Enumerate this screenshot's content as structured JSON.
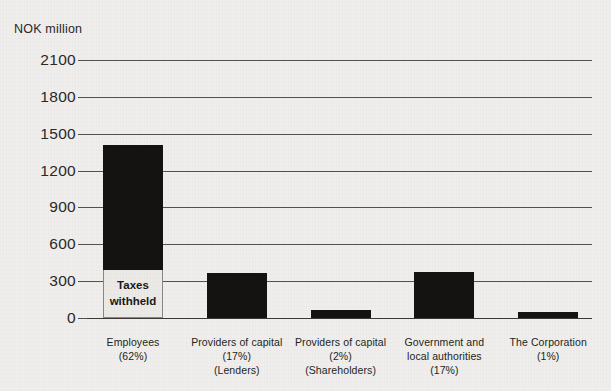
{
  "page": {
    "title_clipped": "VALUE ADDED CREATED",
    "background_color": "#efeeec",
    "bar_color": "#151212"
  },
  "chart_data": {
    "type": "bar",
    "title": "VALUE ADDED CREATED",
    "ylabel": "NOK million",
    "xlabel": "",
    "ylim": [
      0,
      2100
    ],
    "yticks": [
      0,
      300,
      600,
      900,
      1200,
      1500,
      1800,
      2100
    ],
    "ytick_labels": [
      "0",
      "300",
      "600",
      "900",
      "1200",
      "1500",
      "1800",
      "2100"
    ],
    "grid": true,
    "legend": "none",
    "categories": [
      "Employees (62%)",
      "Providers of capital (17%) (Lenders)",
      "Providers of capital (2%) (Shareholders)",
      "Government and local authorities (17%)",
      "The Corporation (1%)"
    ],
    "values": [
      1410,
      370,
      65,
      375,
      45
    ],
    "annotations": [
      {
        "target_category": "Employees (62%)",
        "text": "Taxes withheld",
        "segment_range": [
          0,
          390
        ]
      }
    ]
  },
  "axis": {
    "unit_caption": "NOK million",
    "ticks": [
      {
        "label": "2100"
      },
      {
        "label": "1800"
      },
      {
        "label": "1500"
      },
      {
        "label": "1200"
      },
      {
        "label": "900"
      },
      {
        "label": "600"
      },
      {
        "label": "300"
      },
      {
        "label": "0"
      }
    ]
  },
  "bars": [
    {
      "name": "employees",
      "value": 1410,
      "label_lines": [
        "Employees",
        "(62%)"
      ],
      "annotation_lines": [
        "Taxes",
        "withheld"
      ]
    },
    {
      "name": "providers-of-capital-lenders",
      "value": 370,
      "label_lines": [
        "Providers of capital",
        "(17%)",
        "(Lenders)"
      ],
      "annotation_lines": []
    },
    {
      "name": "providers-of-capital-shareholders",
      "value": 65,
      "label_lines": [
        "Providers of capital",
        "(2%)",
        "(Shareholders)"
      ],
      "annotation_lines": []
    },
    {
      "name": "government-and-local-authorities",
      "value": 375,
      "label_lines": [
        "Government and",
        "local authorities",
        "(17%)"
      ],
      "annotation_lines": []
    },
    {
      "name": "the-corporation",
      "value": 45,
      "label_lines": [
        "The Corporation",
        "(1%)"
      ],
      "annotation_lines": []
    }
  ]
}
